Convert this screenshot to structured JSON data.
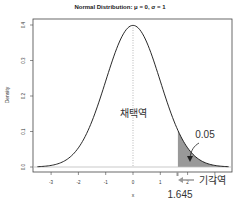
{
  "chart_data": {
    "type": "line",
    "title": "Normal Distribution: μ = 0, σ = 1",
    "xlabel": "x",
    "ylabel": "Density",
    "xlim": [
      -3.5,
      3.5
    ],
    "ylim": [
      0,
      0.4
    ],
    "x_ticks": [
      -3,
      -2,
      -1,
      0,
      1,
      2,
      3
    ],
    "y_ticks": [
      0.0,
      0.1,
      0.2,
      0.3,
      0.4
    ],
    "y_tick_labels": [
      "0.0",
      "0.1",
      "0.2",
      "0.3",
      "0.4"
    ],
    "series": [
      {
        "name": "standard normal density",
        "mu": 0,
        "sigma": 1,
        "peak": 0.399
      }
    ],
    "shaded_region": {
      "from": 1.645,
      "to": 3.5,
      "area": 0.05
    },
    "vertical_line": {
      "x": 0,
      "style": "dotted"
    },
    "annotations": [
      {
        "text": "채택역",
        "meaning": "acceptance region",
        "x": 0,
        "y": 0.12
      },
      {
        "text": "0.05",
        "meaning": "tail area",
        "x": 2.6,
        "y": 0.08
      },
      {
        "text": "1.645",
        "meaning": "critical value",
        "x": 1.645
      },
      {
        "text": "기각역",
        "meaning": "rejection region",
        "x": 2.9
      }
    ]
  },
  "labels": {
    "title": "Normal Distribution: μ = 0, σ = 1",
    "xlabel": "x",
    "ylabel": "Density",
    "acceptance": "채택역",
    "tail_area": "0.05",
    "critical": "1.645",
    "rejection": "기각역"
  }
}
